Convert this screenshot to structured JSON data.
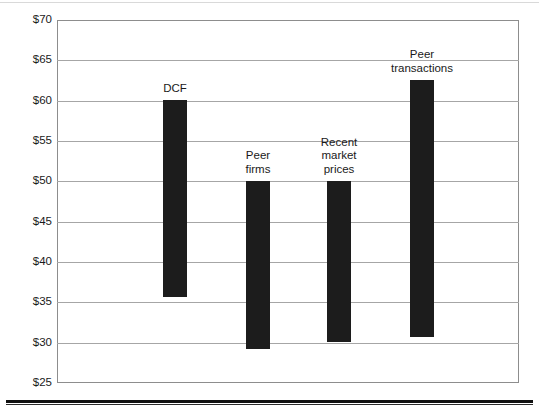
{
  "page": {
    "background_color": "#ffffff",
    "rule_color": "#111111"
  },
  "chart_data": {
    "type": "bar",
    "subtype": "floating-range-bar",
    "title": "",
    "subtitle": "",
    "xlabel": "",
    "ylabel": "",
    "ylim": [
      25,
      70
    ],
    "ytick_step": 5,
    "ytick_labels": [
      "$70",
      "$65",
      "$60",
      "$55",
      "$50",
      "$45",
      "$40",
      "$35",
      "$30",
      "$25"
    ],
    "ytick_values": [
      70,
      65,
      60,
      55,
      50,
      45,
      40,
      35,
      30,
      25
    ],
    "grid": true,
    "grid_axis": "y",
    "legend": false,
    "bar_color": "#1c1c1c",
    "categories": [
      "DCF",
      "Peer firms",
      "Recent market prices",
      "Peer transactions"
    ],
    "category_labels": [
      "DCF",
      "Peer\nfirms",
      "Recent\nmarket\nprices",
      "Peer\ntransactions"
    ],
    "low": [
      35.7,
      29.2,
      30.0,
      30.8
    ],
    "high": [
      60.1,
      50.0,
      50.0,
      62.6
    ],
    "bars": [
      {
        "label": "DCF",
        "label_display": "DCF",
        "low": 35.7,
        "high": 60.1
      },
      {
        "label": "Peer firms",
        "label_display": "Peer\nfirms",
        "low": 29.2,
        "high": 50.0
      },
      {
        "label": "Recent market prices",
        "label_display": "Recent\nmarket\nprices",
        "low": 30.0,
        "high": 50.0
      },
      {
        "label": "Peer transactions",
        "label_display": "Peer\ntransactions",
        "low": 30.8,
        "high": 62.6
      }
    ]
  }
}
